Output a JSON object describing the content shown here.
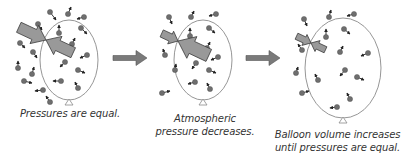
{
  "diagram": {
    "colors": {
      "balloon_outline": "#8a8a8a",
      "molecule": "#6e6e6e",
      "vector": "#222222",
      "pressure_arrow_fill": "#999999",
      "pressure_arrow_stroke": "#3a3a3a",
      "step_arrow": "#7a7a7a",
      "text": "#333333"
    },
    "panels": [
      {
        "id": "equal",
        "caption_lines": [
          "Pressures are equal."
        ],
        "balloon": {
          "cx": 69,
          "cy": 60,
          "rx": 29,
          "ry": 40
        },
        "pressure_arrows": {
          "outside": {
            "tip": [
              46,
              40
            ],
            "length": 30,
            "width": 10,
            "angle": 25
          },
          "inside": {
            "tip": [
              46,
              40
            ],
            "length": 30,
            "width": 10,
            "angle": 205
          }
        },
        "molecules": [
          [
            50,
            12,
            6,
            8
          ],
          [
            68,
            14,
            3,
            -7
          ],
          [
            84,
            17,
            -7,
            2
          ],
          [
            38,
            24,
            4,
            6
          ],
          [
            81,
            28,
            6,
            6
          ],
          [
            59,
            33,
            0,
            -8
          ],
          [
            20,
            43,
            5,
            5
          ],
          [
            33,
            52,
            4,
            6
          ],
          [
            72,
            44,
            3,
            -6
          ],
          [
            87,
            55,
            -7,
            3
          ],
          [
            18,
            68,
            0,
            -7
          ],
          [
            32,
            74,
            2,
            -7
          ],
          [
            65,
            62,
            -5,
            5
          ],
          [
            78,
            70,
            7,
            3
          ],
          [
            24,
            81,
            8,
            2
          ],
          [
            61,
            81,
            -8,
            0
          ],
          [
            78,
            88,
            -3,
            -6
          ],
          [
            43,
            90,
            -8,
            1
          ],
          [
            50,
            102,
            -4,
            -6
          ]
        ]
      },
      {
        "id": "decreases",
        "caption_lines": [
          "Atmospheric",
          "pressure decreases."
        ],
        "balloon": {
          "cx": 203,
          "cy": 60,
          "rx": 29,
          "ry": 40
        },
        "pressure_arrows": {
          "outside": {
            "tip": [
              178,
              41
            ],
            "length": 18,
            "width": 7,
            "angle": 25
          },
          "inside": {
            "tip": [
              178,
              41
            ],
            "length": 34,
            "width": 12,
            "angle": 205
          }
        },
        "molecules": [
          [
            169,
            17,
            3,
            7
          ],
          [
            191,
            17,
            3,
            -6
          ],
          [
            216,
            14,
            -7,
            2
          ],
          [
            209,
            28,
            6,
            5
          ],
          [
            190,
            36,
            0,
            -8
          ],
          [
            207,
            48,
            3,
            -6
          ],
          [
            218,
            57,
            -7,
            3
          ],
          [
            165,
            55,
            -2,
            -6
          ],
          [
            196,
            63,
            -4,
            6
          ],
          [
            175,
            70,
            1,
            -6
          ],
          [
            209,
            70,
            7,
            3
          ],
          [
            195,
            82,
            -7,
            2
          ],
          [
            210,
            89,
            -3,
            -6
          ],
          [
            162,
            93,
            8,
            -2
          ]
        ]
      },
      {
        "id": "increases",
        "caption_lines": [
          "Balloon volume increases",
          "until pressures are equal."
        ],
        "balloon": {
          "cx": 343,
          "cy": 68,
          "rx": 38,
          "ry": 50
        },
        "pressure_arrows": {
          "outside": {
            "tip": [
              311,
              43
            ],
            "length": 16,
            "width": 6,
            "angle": 25
          },
          "inside": {
            "tip": [
              311,
              43
            ],
            "length": 16,
            "width": 6,
            "angle": 205
          }
        },
        "molecules": [
          [
            304,
            19,
            3,
            7
          ],
          [
            329,
            17,
            2,
            -7
          ],
          [
            354,
            14,
            -7,
            2
          ],
          [
            344,
            29,
            6,
            5
          ],
          [
            326,
            37,
            0,
            -8
          ],
          [
            340,
            52,
            3,
            -6
          ],
          [
            368,
            53,
            -7,
            3
          ],
          [
            302,
            50,
            -4,
            -6
          ],
          [
            345,
            70,
            -5,
            6
          ],
          [
            318,
            80,
            -3,
            -6
          ],
          [
            357,
            77,
            7,
            3
          ],
          [
            302,
            93,
            7,
            -2
          ],
          [
            350,
            99,
            -3,
            -6
          ],
          [
            337,
            107,
            -7,
            1
          ],
          [
            296,
            73,
            2,
            -6
          ]
        ]
      }
    ],
    "step_arrows": [
      {
        "x": 113,
        "y": 58,
        "length": 34
      },
      {
        "x": 246,
        "y": 58,
        "length": 34
      }
    ]
  }
}
